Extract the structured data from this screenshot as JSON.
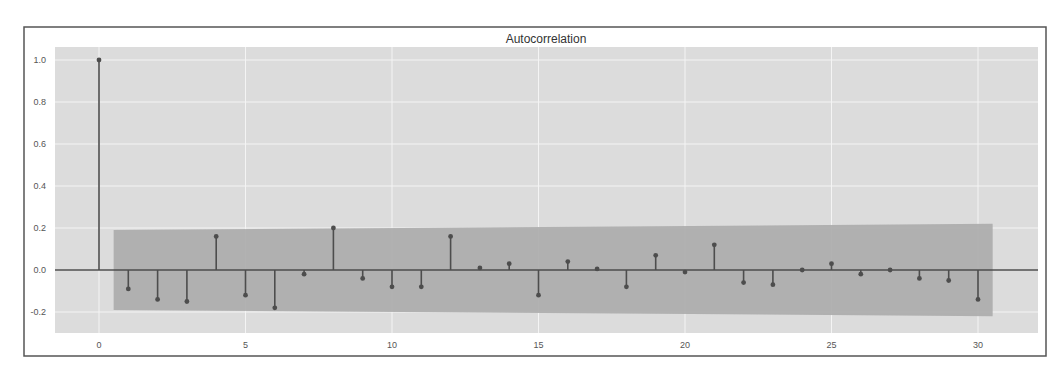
{
  "chart_data": {
    "type": "stem",
    "title": "Autocorrelation",
    "xlabel": "",
    "ylabel": "",
    "x": [
      0,
      1,
      2,
      3,
      4,
      5,
      6,
      7,
      8,
      9,
      10,
      11,
      12,
      13,
      14,
      15,
      16,
      17,
      18,
      19,
      20,
      21,
      22,
      23,
      24,
      25,
      26,
      27,
      28,
      29,
      30
    ],
    "values": [
      1.0,
      -0.09,
      -0.14,
      -0.15,
      0.16,
      -0.12,
      -0.18,
      -0.02,
      0.2,
      -0.04,
      -0.08,
      -0.08,
      0.16,
      0.01,
      0.03,
      -0.12,
      0.04,
      0.005,
      -0.08,
      0.07,
      -0.01,
      0.12,
      -0.06,
      -0.07,
      0.0,
      0.03,
      -0.02,
      0.0,
      -0.04,
      -0.05,
      -0.14
    ],
    "confidence_band": {
      "x_start": 0.5,
      "x_end": 30.5,
      "upper_start": 0.19,
      "upper_end": 0.22,
      "lower_start": -0.19,
      "lower_end": -0.22
    },
    "xlim": [
      -1.5,
      32
    ],
    "ylim": [
      -0.3,
      1.05
    ],
    "xticks": [
      0,
      5,
      10,
      15,
      20,
      25,
      30
    ],
    "xtick_labels": [
      "0",
      "5",
      "10",
      "15",
      "20",
      "25",
      "30"
    ],
    "yticks": [
      -0.2,
      0.0,
      0.2,
      0.4,
      0.6,
      0.8,
      1.0
    ],
    "ytick_labels": [
      "-0.2",
      "0.0",
      "0.2",
      "0.4",
      "0.6",
      "0.8",
      "1.0"
    ],
    "grid": true,
    "legend": null
  },
  "colors": {
    "plot_background": "#dcdcdc",
    "band": "#ababab",
    "stem": "#4d4d4d",
    "grid": "#f4f4f4",
    "frame": "#555555"
  }
}
